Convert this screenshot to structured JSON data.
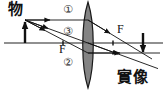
{
  "figure": {
    "labels": {
      "object": "物",
      "image": "實像",
      "focal_left": "F",
      "focal_right": "F",
      "ray1": "①",
      "ray2": "②",
      "ray3": "③"
    },
    "colors": {
      "ink": "#111111",
      "axis": "#222222",
      "lens_fill": "#6f6f6f",
      "lens_stroke": "#1a1a1a",
      "background": "#ffffff"
    },
    "geometry": {
      "principal_axis_y": 43,
      "axis_x_start": 4,
      "axis_x_end": 163,
      "lens_center_x": 88,
      "lens_top_y": 2,
      "lens_bottom_y": 88,
      "lens_half_width": 5,
      "object_base_x": 25,
      "object_tip_y": 20,
      "image_base_x": 143,
      "image_tip_y": 55,
      "focal_left_x": 63,
      "focal_right_x": 113
    },
    "rays": [
      {
        "id": "①",
        "description": "parallel ray from object tip to lens, refracts through right focal point",
        "incident": "from object tip horizontally to lens",
        "refracted": "through right focus F to image tip"
      },
      {
        "id": "②",
        "description": "ray from object tip through left focal point F to lens, emerges parallel to axis",
        "incident": "through left focus F",
        "refracted": "parallel to principal axis to image tip"
      },
      {
        "id": "③",
        "description": "ray from object tip through lens center, continues undeviated",
        "incident": "to lens center",
        "refracted": "straight line to image tip"
      }
    ]
  }
}
